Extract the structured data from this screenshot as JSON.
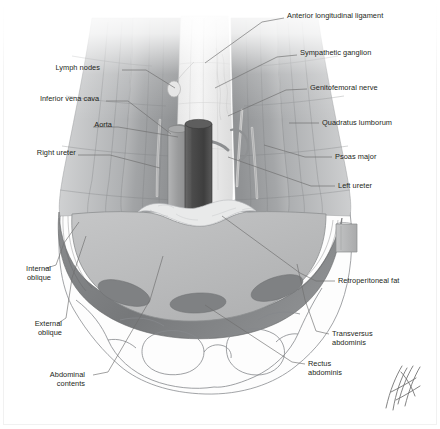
{
  "figure": {
    "domain": "anatomical-illustration",
    "style": "grayscale medical illustration",
    "width": 440,
    "height": 429,
    "background_color": "#ffffff",
    "border_color": "#f1f1f1"
  },
  "palette": {
    "label_text": "#231f20",
    "leader_line": "#6e6e6e",
    "outline": "#55595c",
    "aorta": "#4a4a4a",
    "inferior_vena_cava": "#9a9a9a",
    "psoas_major": "#9d9fa1",
    "quadratus_lumborum": "#b0b2b4",
    "abdominal_cavity": "#b9babb",
    "retroperitoneal_fat": "#7d7f81",
    "oblique_muscle": "#808080",
    "vertebral_body": "#efefef",
    "skin_outline": "#8a8d90",
    "signature": "#6d6d6d"
  },
  "labels": [
    {
      "id": "anterior-longitudinal-ligament",
      "text": "Anterior longitudinal ligament",
      "side": "right",
      "lines": [
        "Anterior longitudinal ligament"
      ],
      "text_x": 287,
      "text_y": 11,
      "leader": [
        [
          284,
          18
        ],
        [
          262,
          22
        ],
        [
          205,
          63
        ]
      ]
    },
    {
      "id": "sympathetic-ganglion",
      "text": "Sympathetic ganglion",
      "side": "right",
      "lines": [
        "Sympathetic ganglion"
      ],
      "text_x": 300,
      "text_y": 48,
      "leader": [
        [
          297,
          55
        ],
        [
          277,
          57
        ],
        [
          215,
          88
        ]
      ]
    },
    {
      "id": "genitofemoral-nerve",
      "text": "Genitofemoral nerve",
      "side": "right",
      "lines": [
        "Genitofemoral nerve"
      ],
      "text_x": 310,
      "text_y": 83,
      "leader": [
        [
          307,
          89
        ],
        [
          286,
          90
        ],
        [
          228,
          116
        ]
      ]
    },
    {
      "id": "quadratus-lumborum",
      "text": "Quadratus lumborum",
      "side": "right",
      "lines": [
        "Quadratus lumborum"
      ],
      "text_x": 322,
      "text_y": 118,
      "leader": [
        [
          319,
          123
        ],
        [
          289,
          123
        ]
      ]
    },
    {
      "id": "psoas-major",
      "text": "Psoas major",
      "side": "right",
      "lines": [
        "Psoas major"
      ],
      "text_x": 335,
      "text_y": 152,
      "leader": [
        [
          332,
          157
        ],
        [
          305,
          157
        ],
        [
          264,
          145
        ]
      ]
    },
    {
      "id": "left-ureter",
      "text": "Left ureter",
      "side": "right",
      "lines": [
        "Left ureter"
      ],
      "text_x": 338,
      "text_y": 181,
      "leader": [
        [
          335,
          186
        ],
        [
          311,
          186
        ],
        [
          228,
          157
        ]
      ]
    },
    {
      "id": "retroperitoneal-fat",
      "text": "Retroperitoneal fat",
      "side": "right",
      "lines": [
        "Retroperitoneal fat"
      ],
      "text_x": 338,
      "text_y": 276,
      "leader": [
        [
          335,
          281
        ],
        [
          316,
          281
        ],
        [
          300,
          273
        ],
        [
          222,
          216
        ]
      ]
    },
    {
      "id": "transversus-abdominis",
      "text": "Transversus abdominis",
      "side": "right",
      "lines": [
        "Transversus",
        "abdominis"
      ],
      "text_x": 332,
      "text_y": 329,
      "leader": [
        [
          329,
          334
        ],
        [
          316,
          331
        ],
        [
          305,
          300
        ],
        [
          297,
          264
        ]
      ]
    },
    {
      "id": "rectus-abdominis",
      "text": "Rectus abdominis",
      "side": "right",
      "lines": [
        "Rectus",
        "abdominis"
      ],
      "text_x": 308,
      "text_y": 359,
      "leader": [
        [
          305,
          364
        ],
        [
          292,
          362
        ],
        [
          205,
          305
        ]
      ]
    },
    {
      "id": "lymph-nodes",
      "text": "Lymph nodes",
      "side": "left",
      "lines": [
        "Lymph nodes"
      ],
      "text_x": 57,
      "text_y": 63,
      "leader": [
        [
          122,
          70
        ],
        [
          146,
          70
        ],
        [
          175,
          88
        ]
      ]
    },
    {
      "id": "inferior-vena-cava",
      "text": "Inferior vena cava",
      "side": "left",
      "lines": [
        "Inferior vena cava"
      ],
      "text_x": 29,
      "text_y": 94,
      "leader": [
        [
          106,
          101
        ],
        [
          128,
          101
        ],
        [
          171,
          134
        ]
      ]
    },
    {
      "id": "aorta",
      "text": "Aorta",
      "side": "left",
      "lines": [
        "Aorta"
      ],
      "text_x": 72,
      "text_y": 120,
      "leader": [
        [
          93,
          127
        ],
        [
          118,
          127
        ],
        [
          178,
          137
        ]
      ]
    },
    {
      "id": "right-ureter",
      "text": "Right ureter",
      "side": "left",
      "lines": [
        "Right ureter"
      ],
      "text_x": 29,
      "text_y": 148,
      "leader": [
        [
          78,
          155
        ],
        [
          110,
          155
        ],
        [
          160,
          168
        ]
      ]
    },
    {
      "id": "internal-oblique",
      "text": "Internal oblique",
      "side": "left",
      "lines": [
        "Internal",
        "oblique"
      ],
      "text_x": 11,
      "text_y": 264,
      "leader": [
        [
          44,
          269
        ],
        [
          56,
          265
        ],
        [
          64,
          243
        ],
        [
          79,
          222
        ]
      ]
    },
    {
      "id": "external-oblique",
      "text": "External oblique",
      "side": "left",
      "lines": [
        "External",
        "oblique"
      ],
      "text_x": 22,
      "text_y": 319,
      "leader": [
        [
          57,
          324
        ],
        [
          66,
          318
        ],
        [
          72,
          278
        ],
        [
          86,
          236
        ]
      ]
    },
    {
      "id": "abdominal-contents",
      "text": "Abdominal contents",
      "side": "left",
      "lines": [
        "Abdominal",
        "contents"
      ],
      "text_x": 45,
      "text_y": 370,
      "leader": [
        [
          93,
          375
        ],
        [
          108,
          372
        ],
        [
          150,
          300
        ],
        [
          163,
          256
        ]
      ]
    }
  ],
  "structures": [
    {
      "id": "vertebral-body",
      "name": "Vertebral body with anterior longitudinal ligament"
    },
    {
      "id": "psoas-major-left",
      "name": "Psoas major (left)"
    },
    {
      "id": "psoas-major-right",
      "name": "Psoas major (right)"
    },
    {
      "id": "quadratus-lumborum-muscle",
      "name": "Quadratus lumborum"
    },
    {
      "id": "aorta-vessel",
      "name": "Abdominal aorta"
    },
    {
      "id": "ivc-vessel",
      "name": "Inferior vena cava"
    },
    {
      "id": "abdominal-cavity-mass",
      "name": "Abdominal contents"
    },
    {
      "id": "retroperitoneal-fat-band",
      "name": "Retroperitoneal fat"
    },
    {
      "id": "rectus-abdominis-left",
      "name": "Rectus abdominis (left)"
    },
    {
      "id": "rectus-abdominis-right",
      "name": "Rectus abdominis (right)"
    },
    {
      "id": "oblique-patch-left",
      "name": "Oblique muscle cross-section (left)"
    },
    {
      "id": "oblique-patch-right",
      "name": "Oblique muscle cross-section (right)"
    }
  ],
  "signature": {
    "present": true,
    "description": "artist monogram of crossing diagonal pen strokes",
    "x": 383,
    "y": 368
  }
}
